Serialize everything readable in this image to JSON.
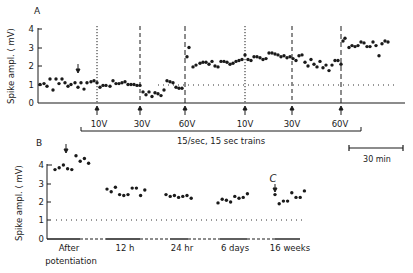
{
  "figure": {
    "panel_a_label": "A",
    "panel_b_label": "B",
    "ylabel": "Spike ampl. ( mV)",
    "train_bracket_label": "15/sec, 15 sec trains",
    "scale_bar_label": "30 min",
    "marker_c_label": "C"
  },
  "chart_data": [
    {
      "type": "scatter",
      "panel": "A",
      "title": "",
      "xlabel": "time (scale bar = 30 min)",
      "ylabel": "Spike ampl. ( mV)",
      "yticks": [
        0,
        1,
        2,
        3,
        4
      ],
      "ylim": [
        0,
        4
      ],
      "grid": false,
      "baseline_mV": 1.0,
      "stimuli": [
        {
          "label": "10V",
          "x_px": 97,
          "style": "dotted"
        },
        {
          "label": "30V",
          "x_px": 140,
          "style": "dashed"
        },
        {
          "label": "60V",
          "x_px": 185,
          "style": "dashed"
        },
        {
          "label": "10V",
          "x_px": 245,
          "style": "dotted"
        },
        {
          "label": "30V",
          "x_px": 292,
          "style": "dashed"
        },
        {
          "label": "60V",
          "x_px": 341,
          "style": "dashed"
        }
      ],
      "bracket_label": "15/sec, 15 sec trains",
      "scale_bar": "30 min",
      "annotations": [
        "down arrow over baseline at x≈78 px"
      ],
      "points": [
        [
          40,
          1.0
        ],
        [
          44,
          1.05
        ],
        [
          47,
          0.9
        ],
        [
          50,
          1.3
        ],
        [
          53,
          0.7
        ],
        [
          56,
          1.3
        ],
        [
          59,
          1.05
        ],
        [
          62,
          1.3
        ],
        [
          65,
          1.1
        ],
        [
          68,
          0.9
        ],
        [
          71,
          1.0
        ],
        [
          75,
          1.1
        ],
        [
          78,
          0.85
        ],
        [
          81,
          1.1
        ],
        [
          84,
          0.75
        ],
        [
          87,
          1.1
        ],
        [
          91,
          1.15
        ],
        [
          94,
          1.2
        ],
        [
          97,
          1.1
        ],
        [
          100,
          0.85
        ],
        [
          103,
          0.95
        ],
        [
          106,
          0.95
        ],
        [
          110,
          0.9
        ],
        [
          113,
          1.2
        ],
        [
          116,
          1.05
        ],
        [
          119,
          1.05
        ],
        [
          122,
          1.1
        ],
        [
          125,
          1.15
        ],
        [
          128,
          1.0
        ],
        [
          131,
          1.0
        ],
        [
          134,
          1.0
        ],
        [
          137,
          0.95
        ],
        [
          140,
          0.95
        ],
        [
          143,
          0.6
        ],
        [
          146,
          0.45
        ],
        [
          149,
          0.6
        ],
        [
          152,
          0.35
        ],
        [
          155,
          0.55
        ],
        [
          158,
          0.5
        ],
        [
          161,
          0.4
        ],
        [
          164,
          0.7
        ],
        [
          167,
          1.2
        ],
        [
          170,
          1.15
        ],
        [
          173,
          1.1
        ],
        [
          176,
          0.85
        ],
        [
          179,
          0.8
        ],
        [
          182,
          0.8
        ],
        [
          187,
          2.5
        ],
        [
          189,
          3.0
        ],
        [
          193,
          1.95
        ],
        [
          196,
          2.05
        ],
        [
          200,
          2.15
        ],
        [
          203,
          2.2
        ],
        [
          206,
          2.2
        ],
        [
          209,
          2.1
        ],
        [
          212,
          2.25
        ],
        [
          215,
          2.0
        ],
        [
          218,
          1.95
        ],
        [
          221,
          2.25
        ],
        [
          224,
          2.25
        ],
        [
          227,
          2.2
        ],
        [
          230,
          2.1
        ],
        [
          233,
          2.15
        ],
        [
          236,
          2.25
        ],
        [
          239,
          2.3
        ],
        [
          242,
          2.35
        ],
        [
          245,
          2.6
        ],
        [
          248,
          2.35
        ],
        [
          251,
          2.3
        ],
        [
          254,
          2.5
        ],
        [
          257,
          2.5
        ],
        [
          260,
          2.45
        ],
        [
          263,
          2.35
        ],
        [
          266,
          2.4
        ],
        [
          269,
          2.7
        ],
        [
          272,
          2.7
        ],
        [
          275,
          2.65
        ],
        [
          278,
          2.6
        ],
        [
          281,
          2.5
        ],
        [
          284,
          2.55
        ],
        [
          287,
          2.45
        ],
        [
          290,
          2.5
        ],
        [
          293,
          2.4
        ],
        [
          296,
          2.3
        ],
        [
          299,
          2.55
        ],
        [
          302,
          2.6
        ],
        [
          305,
          2.2
        ],
        [
          308,
          2.0
        ],
        [
          311,
          2.35
        ],
        [
          314,
          2.1
        ],
        [
          317,
          1.95
        ],
        [
          320,
          2.25
        ],
        [
          323,
          1.9
        ],
        [
          326,
          2.05
        ],
        [
          329,
          1.75
        ],
        [
          332,
          2.05
        ],
        [
          335,
          2.3
        ],
        [
          338,
          2.3
        ],
        [
          341,
          2.1
        ],
        [
          343,
          3.35
        ],
        [
          345,
          3.5
        ],
        [
          349,
          3.0
        ],
        [
          352,
          3.1
        ],
        [
          355,
          3.05
        ],
        [
          358,
          3.1
        ],
        [
          361,
          3.3
        ],
        [
          364,
          3.25
        ],
        [
          367,
          3.05
        ],
        [
          370,
          3.05
        ],
        [
          373,
          3.3
        ],
        [
          376,
          3.1
        ],
        [
          379,
          2.55
        ],
        [
          382,
          3.2
        ],
        [
          385,
          3.35
        ],
        [
          388,
          3.3
        ]
      ]
    },
    {
      "type": "scatter",
      "panel": "B",
      "title": "",
      "xlabel": "",
      "ylabel": "Spike ampl. ( mV)",
      "yticks": [
        0,
        1,
        2,
        3,
        4
      ],
      "ylim": [
        0,
        4
      ],
      "grid": false,
      "baseline_mV": 1.0,
      "categories": [
        "After potentiation",
        "12 h",
        "24 hr",
        "6 days",
        "16 weeks"
      ],
      "annotations": [
        "down arrow at after potentiation",
        "C marker with down arrow at 16 weeks"
      ],
      "series": [
        {
          "name": "After potentiation",
          "values": [
            3.75,
            3.85,
            4.0,
            3.8,
            3.75,
            4.5,
            4.2,
            4.35,
            4.1
          ]
        },
        {
          "name": "12 h",
          "values": [
            2.7,
            2.55,
            2.8,
            2.4,
            2.35,
            2.4,
            2.75,
            2.75,
            2.35,
            2.65
          ]
        },
        {
          "name": "24 hr",
          "values": [
            2.4,
            2.3,
            2.35,
            2.25,
            2.3,
            2.35,
            2.2
          ]
        },
        {
          "name": "6 days",
          "values": [
            1.95,
            2.15,
            2.1,
            2.0,
            2.3,
            2.2,
            2.25,
            2.45
          ]
        },
        {
          "name": "16 weeks",
          "values": [
            2.4,
            1.9,
            2.05,
            2.05,
            2.5,
            2.25,
            2.25,
            2.6
          ]
        }
      ]
    }
  ],
  "axes_text": {
    "a_yticks": [
      "0",
      "1",
      "2",
      "3",
      "4"
    ],
    "b_yticks": [
      "0",
      "1",
      "2",
      "3",
      "4"
    ],
    "a_stim_labels": [
      "10V",
      "30V",
      "60V",
      "10V",
      "30V",
      "60V"
    ],
    "b_cat_labels": [
      "After",
      "potentiation",
      "12 h",
      "24 hr",
      "6 days",
      "16 weeks"
    ]
  }
}
